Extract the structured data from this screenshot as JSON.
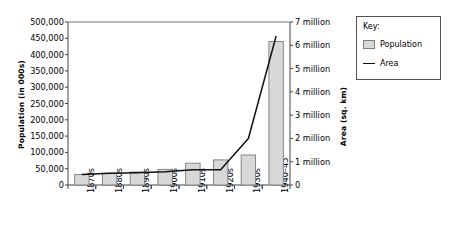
{
  "chart_data": {
    "type": "bar",
    "title": "",
    "subtitle": "",
    "categories": [
      "1870s",
      "1880s",
      "1890s",
      "1900s",
      "1910s",
      "1920s",
      "1930s",
      "1940–45"
    ],
    "series": [
      {
        "name": "Population",
        "type": "bar",
        "axis": "left",
        "unit": "thousands",
        "values": [
          32000,
          36000,
          40000,
          48000,
          67000,
          77000,
          92000,
          440000
        ],
        "color": "#d8d8d8",
        "border_color": "#7a7a7a"
      },
      {
        "name": "Area",
        "type": "line",
        "axis": "right",
        "unit": "sq. km",
        "values": [
          450000,
          500000,
          530000,
          570000,
          650000,
          660000,
          2000000,
          6400000
        ],
        "color": "#111111"
      }
    ],
    "xlabel": "",
    "ylabel": "Population (in 000s)",
    "y2label": "Area (sq. km)",
    "ylim": [
      0,
      500000
    ],
    "y2lim": [
      0,
      7000000
    ],
    "ytick_labels": [
      "0",
      "50,000",
      "100,000",
      "150,000",
      "200,000",
      "250,000",
      "300,000",
      "350,000",
      "400,000",
      "450,000",
      "500,000"
    ],
    "ytick_values": [
      0,
      50000,
      100000,
      150000,
      200000,
      250000,
      300000,
      350000,
      400000,
      450000,
      500000
    ],
    "y2tick_labels": [
      "0",
      "1 million",
      "2 million",
      "3 million",
      "4 million",
      "5 million",
      "6 million",
      "7 million"
    ],
    "y2tick_values": [
      0,
      1000000,
      2000000,
      3000000,
      4000000,
      5000000,
      6000000,
      7000000
    ],
    "grid": false,
    "legend_position": "right-outside"
  },
  "legend": {
    "title": "Key:",
    "entries": [
      {
        "label": "Population",
        "marker": "bar-swatch-icon"
      },
      {
        "label": "Area",
        "marker": "line-swatch-icon"
      }
    ]
  }
}
